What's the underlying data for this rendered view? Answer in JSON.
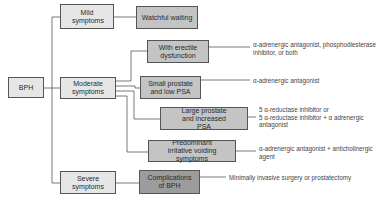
{
  "diagram": {
    "root": {
      "label": "BPH"
    },
    "categories": [
      {
        "id": "mild",
        "label": "Mild symptoms"
      },
      {
        "id": "moderate",
        "label": "Moderate symptoms"
      },
      {
        "id": "severe",
        "label": "Severe symptoms"
      }
    ],
    "mild_outcome": {
      "label": "Watchful waiting"
    },
    "moderate_branches": [
      {
        "label": "With erectile dysfunction",
        "treatment": "α-adrenergic antagonist, phosphodiesterase inhibitor, or both"
      },
      {
        "label": "Small prostate and low PSA",
        "treatment": "α-adrenergic antagonist"
      },
      {
        "label": "Large prostate and increased PSA",
        "treatment_lines": [
          "5 α-reductase inhibitor or",
          "5 α-reductase inhibitor + α adrenergic",
          "antagonist"
        ]
      },
      {
        "label": "Predominant irritative voiding symptoms",
        "treatment_lines": [
          "α-adrenergic antagonist + anticholinergic",
          "agent"
        ]
      }
    ],
    "severe_branch": {
      "label": "Complications of BPH",
      "treatment": "Minimally invasive surgery or prostatectomy"
    },
    "notes": {
      "erectile_line1": "α-adrenergic antagonist, phosphodiesterase",
      "erectile_line2": "inhibitor, or both"
    },
    "colors": {
      "light_box": "#e6e6e6",
      "mid_box": "#c4c4c4",
      "dark_box": "#9c9c9c",
      "border": "#555555"
    }
  }
}
